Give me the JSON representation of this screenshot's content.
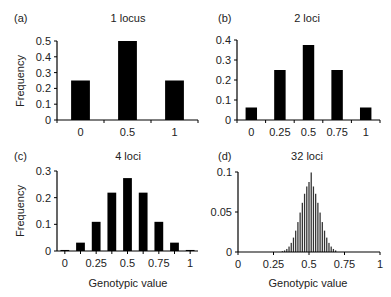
{
  "figure": {
    "xlabel_bottom": "Genotypic value",
    "ylabel": "Frequency"
  },
  "chart_data": [
    {
      "panel": "(a)",
      "title": "1 locus",
      "type": "bar",
      "xlabel": "",
      "ylabel": "Frequency",
      "xlim": [
        -0.25,
        1.25
      ],
      "ylim": [
        0,
        0.5
      ],
      "yticks": [
        "0",
        "0.1",
        "0.2",
        "0.3",
        "0.4",
        "0.5"
      ],
      "ytick_values": [
        0,
        0.1,
        0.2,
        0.3,
        0.4,
        0.5
      ],
      "xticks": [
        "0",
        "0.5",
        "1"
      ],
      "xtick_values": [
        0,
        0.5,
        1
      ],
      "x": [
        0,
        0.5,
        1
      ],
      "values": [
        0.25,
        0.5,
        0.25
      ],
      "bar_width": 0.2
    },
    {
      "panel": "(b)",
      "title": "2 loci",
      "type": "bar",
      "xlabel": "",
      "ylabel": "",
      "xlim": [
        -0.125,
        1.125
      ],
      "ylim": [
        0,
        0.4
      ],
      "yticks": [
        "0",
        "0.1",
        "0.2",
        "0.3",
        "0.4"
      ],
      "ytick_values": [
        0,
        0.1,
        0.2,
        0.3,
        0.4
      ],
      "xticks": [
        "0",
        "0.25",
        "0.5",
        "0.75",
        "1"
      ],
      "xtick_values": [
        0,
        0.25,
        0.5,
        0.75,
        1
      ],
      "x": [
        0,
        0.25,
        0.5,
        0.75,
        1
      ],
      "values": [
        0.0625,
        0.25,
        0.375,
        0.25,
        0.0625
      ],
      "bar_width": 0.1
    },
    {
      "panel": "(c)",
      "title": "4 loci",
      "type": "bar",
      "xlabel": "Genotypic value",
      "ylabel": "Frequency",
      "xlim": [
        -0.0625,
        1.0625
      ],
      "ylim": [
        0,
        0.3
      ],
      "yticks": [
        "0",
        "0.1",
        "0.2",
        "0.3"
      ],
      "ytick_values": [
        0,
        0.1,
        0.2,
        0.3
      ],
      "xticks": [
        "0",
        "0.25",
        "0.5",
        "0.75",
        "1"
      ],
      "xtick_values": [
        0,
        0.25,
        0.5,
        0.75,
        1
      ],
      "x": [
        0,
        0.125,
        0.25,
        0.375,
        0.5,
        0.625,
        0.75,
        0.875,
        1
      ],
      "values": [
        0.0039,
        0.0313,
        0.1094,
        0.2188,
        0.2734,
        0.2188,
        0.1094,
        0.0313,
        0.0039
      ],
      "bar_width": 0.07
    },
    {
      "panel": "(d)",
      "title": "32 loci",
      "type": "bar",
      "xlabel": "Genotypic value",
      "ylabel": "",
      "xlim": [
        0,
        1
      ],
      "ylim": [
        0,
        0.1
      ],
      "yticks": [
        "0",
        "0.05",
        "0.1"
      ],
      "ytick_values": [
        0,
        0.05,
        0.1
      ],
      "xticks": [
        "0",
        "0.25",
        "0.5",
        "0.75",
        "1"
      ],
      "xtick_values": [
        0,
        0.25,
        0.5,
        0.75,
        1
      ],
      "x": [
        0.3125,
        0.328125,
        0.34375,
        0.359375,
        0.375,
        0.390625,
        0.40625,
        0.421875,
        0.4375,
        0.453125,
        0.46875,
        0.484375,
        0.5,
        0.515625,
        0.53125,
        0.546875,
        0.5625,
        0.578125,
        0.59375,
        0.609375,
        0.625,
        0.640625,
        0.65625,
        0.671875,
        0.6875
      ],
      "values": [
        0.001,
        0.002,
        0.0038,
        0.0068,
        0.0114,
        0.018,
        0.0267,
        0.0374,
        0.0493,
        0.0615,
        0.0728,
        0.0819,
        0.0875,
        0.0994,
        0.0819,
        0.0728,
        0.0615,
        0.0493,
        0.0374,
        0.0267,
        0.018,
        0.0114,
        0.0068,
        0.0038,
        0.002
      ],
      "bar_width": 0.009
    }
  ]
}
